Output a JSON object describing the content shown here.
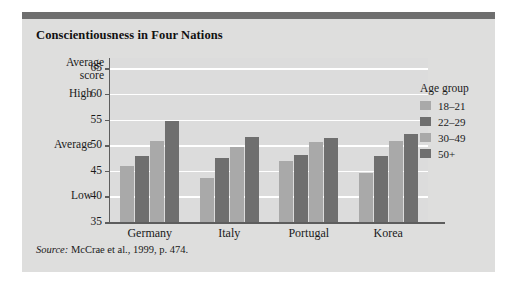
{
  "figure": {
    "title": "Conscientiousness in Four Nations",
    "source_word": "Source:",
    "source_text": " McCrae et al., 1999, p. 474."
  },
  "legend": {
    "title": "Age group",
    "items": [
      {
        "label": "18–21",
        "shade": "light",
        "color": "#a9a9a9"
      },
      {
        "label": "22–29",
        "shade": "dark",
        "color": "#6f6f6f"
      },
      {
        "label": "30–49",
        "shade": "light",
        "color": "#a9a9a9"
      },
      {
        "label": "50+",
        "shade": "dark",
        "color": "#6f6f6f"
      }
    ]
  },
  "axis": {
    "y_title_line1": "Average",
    "y_title_line2": "score",
    "bands": [
      {
        "label": "High",
        "value": 60
      },
      {
        "label": "Average",
        "value": 50
      },
      {
        "label": "Low",
        "value": 40
      }
    ]
  },
  "colors": {
    "panel_background": "#dededd",
    "plot_background": "#dcdcdc",
    "gridline": "#ffffff",
    "axis_line": "#5d5d5d",
    "top_rule": "#6e6e6e",
    "bar_light": "#a9a9a9",
    "bar_dark": "#6f6f6f",
    "text": "#1a1a1a"
  },
  "chart_data": {
    "type": "bar",
    "title": "Conscientiousness in Four Nations",
    "xlabel": "",
    "ylabel": "Average score",
    "ylim": [
      35,
      67
    ],
    "yticks": [
      35,
      40,
      45,
      50,
      55,
      60,
      65
    ],
    "ytick_labels": [
      "35",
      "40",
      "45",
      "50",
      "55",
      "60",
      "65"
    ],
    "grid": true,
    "legend_position": "right",
    "legend_title": "Age group",
    "categories": [
      "Germany",
      "Italy",
      "Portugal",
      "Korea"
    ],
    "series": [
      {
        "name": "18–21",
        "color": "#a9a9a9",
        "values": [
          46.0,
          43.5,
          47.0,
          44.5
        ]
      },
      {
        "name": "22–29",
        "color": "#6f6f6f",
        "values": [
          47.8,
          47.4,
          48.1,
          47.8
        ]
      },
      {
        "name": "30–49",
        "color": "#a9a9a9",
        "values": [
          50.8,
          49.6,
          50.7,
          50.8
        ]
      },
      {
        "name": "50+",
        "color": "#6f6f6f",
        "values": [
          54.8,
          51.6,
          51.3,
          52.1
        ]
      }
    ],
    "annotations": [
      {
        "text": "High",
        "y": 60
      },
      {
        "text": "Average",
        "y": 50
      },
      {
        "text": "Low",
        "y": 40
      }
    ]
  }
}
